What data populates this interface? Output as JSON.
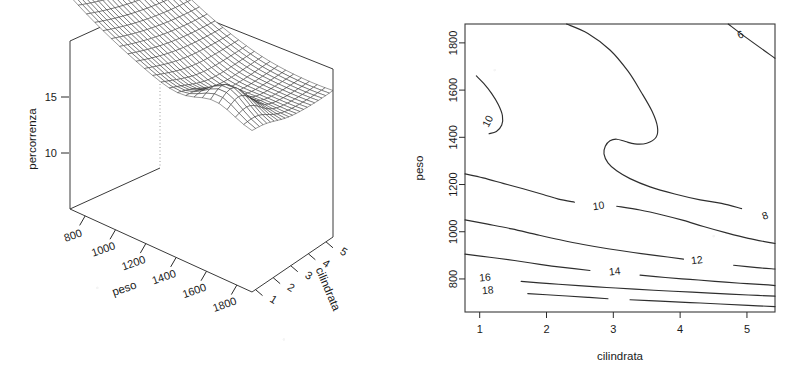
{
  "figure": {
    "width": 811,
    "height": 369,
    "background": "#ffffff",
    "ink": "#1f1f1f",
    "panels": [
      "perspective-surface-plot",
      "contour-plot"
    ]
  },
  "persp": {
    "type": "surface-3d-wireframe",
    "title": "",
    "x": {
      "label": "peso",
      "ticks": [
        800,
        1000,
        1200,
        1400,
        1600,
        1800
      ],
      "min": 700,
      "max": 1900
    },
    "y": {
      "label": "cilindrata",
      "ticks": [
        1,
        2,
        3,
        4,
        5
      ],
      "min": 0.8,
      "max": 5.4
    },
    "z": {
      "label": "percorrenza",
      "ticks": [
        10,
        15
      ],
      "min": 5,
      "max": 20
    },
    "view": {
      "theta": -40,
      "phi": 22,
      "shade": 0.55
    },
    "grid_n": [
      22,
      22
    ]
  },
  "contour": {
    "type": "contour",
    "xlabel": "cilindrata",
    "ylabel": "peso",
    "xticks": [
      1,
      2,
      3,
      4,
      5
    ],
    "yticks": [
      800,
      1000,
      1200,
      1400,
      1600,
      1800
    ],
    "xlim": [
      0.78,
      5.42
    ],
    "ylim": [
      660,
      1880
    ],
    "levels": [
      6,
      8,
      10,
      12,
      14,
      16,
      18
    ],
    "labels": [
      {
        "level": "6",
        "x": 4.9,
        "y": 1835,
        "rot": -22
      },
      {
        "level": "8",
        "x": 5.27,
        "y": 1068,
        "rot": -20
      },
      {
        "level": "10",
        "x": 1.12,
        "y": 1468,
        "rot": -62
      },
      {
        "level": "10",
        "x": 2.78,
        "y": 1110,
        "rot": -8
      },
      {
        "level": "12",
        "x": 4.25,
        "y": 880,
        "rot": -7
      },
      {
        "level": "14",
        "x": 3.02,
        "y": 832,
        "rot": -6
      },
      {
        "level": "16",
        "x": 1.08,
        "y": 806,
        "rot": -5
      },
      {
        "level": "18",
        "x": 1.12,
        "y": 752,
        "rot": -5
      }
    ]
  },
  "chart_data": {
    "type": "contour",
    "title": "",
    "panel_left": {
      "type": "surface",
      "xlabel": "peso",
      "ylabel": "cilindrata",
      "zlabel": "percorrenza",
      "xticks": [
        800,
        1000,
        1200,
        1400,
        1600,
        1800
      ],
      "yticks": [
        1,
        2,
        3,
        4,
        5
      ],
      "zticks": [
        10,
        15
      ],
      "zlim": [
        5,
        20
      ],
      "description": "Fitted regression surface of percorrenza on peso and cilindrata; high percorrenza (about 17) at low peso, falling steeply as peso increases, with a local ridge near cilindrata 1-2 at high peso."
    },
    "panel_right": {
      "type": "contour",
      "xlabel": "cilindrata",
      "ylabel": "peso",
      "xticks": [
        1,
        2,
        3,
        4,
        5
      ],
      "yticks": [
        800,
        1000,
        1200,
        1400,
        1600,
        1800
      ],
      "xlim": [
        0.78,
        5.42
      ],
      "ylim": [
        660,
        1880
      ],
      "levels": [
        6,
        8,
        10,
        12,
        14,
        16,
        18
      ],
      "grid": false,
      "legend": "none",
      "contour_lines": [
        {
          "level": 6,
          "points": [
            [
              4.72,
              1880
            ],
            [
              5.0,
              1820
            ],
            [
              5.42,
              1735
            ]
          ]
        },
        {
          "level": 8,
          "points": [
            [
              2.3,
              1880
            ],
            [
              2.62,
              1840
            ],
            [
              2.95,
              1770
            ],
            [
              3.22,
              1680
            ],
            [
              3.42,
              1590
            ],
            [
              3.58,
              1510
            ],
            [
              3.66,
              1445
            ],
            [
              3.64,
              1400
            ],
            [
              3.5,
              1375
            ],
            [
              3.32,
              1372
            ],
            [
              3.18,
              1382
            ],
            [
              3.05,
              1392
            ],
            [
              2.95,
              1385
            ],
            [
              2.88,
              1362
            ],
            [
              2.86,
              1330
            ],
            [
              2.92,
              1292
            ],
            [
              3.05,
              1258
            ],
            [
              3.25,
              1225
            ],
            [
              3.55,
              1190
            ],
            [
              3.92,
              1160
            ],
            [
              4.3,
              1135
            ],
            [
              4.62,
              1120
            ],
            [
              4.92,
              1098
            ],
            [
              5.2,
              1075
            ],
            [
              5.42,
              1058
            ]
          ]
        },
        {
          "level": 10,
          "points": [
            [
              0.95,
              1660
            ],
            [
              1.06,
              1628
            ],
            [
              1.18,
              1585
            ],
            [
              1.28,
              1538
            ],
            [
              1.34,
              1492
            ],
            [
              1.33,
              1452
            ],
            [
              1.25,
              1425
            ],
            [
              1.14,
              1415
            ]
          ]
        },
        {
          "level": 10,
          "points": [
            [
              0.78,
              1245
            ],
            [
              1.05,
              1228
            ],
            [
              1.35,
              1205
            ],
            [
              1.65,
              1182
            ],
            [
              1.95,
              1158
            ],
            [
              2.18,
              1138
            ],
            [
              2.42,
              1125
            ],
            [
              2.72,
              1115
            ],
            [
              3.05,
              1108
            ],
            [
              3.4,
              1092
            ],
            [
              3.75,
              1070
            ],
            [
              4.05,
              1048
            ],
            [
              4.35,
              1022
            ],
            [
              4.68,
              996
            ],
            [
              5.02,
              972
            ],
            [
              5.42,
              950
            ]
          ]
        },
        {
          "level": 12,
          "points": [
            [
              0.78,
              1050
            ],
            [
              1.12,
              1032
            ],
            [
              1.48,
              1012
            ],
            [
              1.85,
              988
            ],
            [
              2.2,
              966
            ],
            [
              2.55,
              946
            ],
            [
              2.92,
              928
            ],
            [
              3.3,
              912
            ],
            [
              3.68,
              898
            ],
            [
              4.05,
              884
            ],
            [
              4.42,
              870
            ],
            [
              4.8,
              858
            ],
            [
              5.15,
              848
            ],
            [
              5.42,
              842
            ]
          ]
        },
        {
          "level": 14,
          "points": [
            [
              0.78,
              905
            ],
            [
              1.15,
              892
            ],
            [
              1.52,
              878
            ],
            [
              1.9,
              862
            ],
            [
              2.28,
              848
            ],
            [
              2.65,
              836
            ],
            [
              3.02,
              826
            ],
            [
              3.4,
              816
            ],
            [
              3.78,
              806
            ],
            [
              4.15,
              798
            ],
            [
              4.52,
              790
            ],
            [
              4.9,
              782
            ],
            [
              5.25,
              776
            ],
            [
              5.42,
              772
            ]
          ]
        },
        {
          "level": 16,
          "points": [
            [
              0.78,
              808
            ],
            [
              1.2,
              800
            ],
            [
              1.62,
              790
            ],
            [
              2.05,
              780
            ],
            [
              2.48,
              772
            ],
            [
              2.9,
              764
            ],
            [
              3.32,
              757
            ],
            [
              3.75,
              750
            ],
            [
              4.18,
              744
            ],
            [
              4.6,
              738
            ],
            [
              5.02,
              732
            ],
            [
              5.42,
              727
            ]
          ]
        },
        {
          "level": 18,
          "points": [
            [
              0.78,
              754
            ],
            [
              1.25,
              746
            ],
            [
              1.72,
              738
            ],
            [
              2.18,
              730
            ],
            [
              2.62,
              722
            ],
            [
              2.92,
              716
            ]
          ]
        },
        {
          "level": 18,
          "points": [
            [
              3.25,
              712
            ],
            [
              3.7,
              706
            ],
            [
              4.15,
              700
            ],
            [
              4.6,
              694
            ],
            [
              5.02,
              688
            ],
            [
              5.42,
              683
            ]
          ]
        }
      ]
    }
  }
}
